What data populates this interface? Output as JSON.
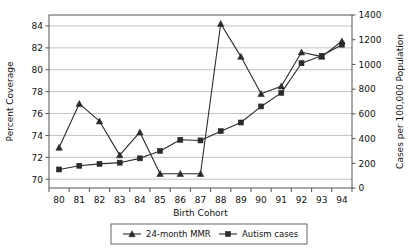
{
  "chart_data": {
    "type": "line",
    "title": "",
    "xlabel": "Birth Cohort",
    "ylabel": "Percent Coverage",
    "y2label": "Cases per 100,000 Population",
    "categories": [
      "80",
      "81",
      "82",
      "83",
      "84",
      "85",
      "86",
      "87",
      "88",
      "89",
      "90",
      "91",
      "92",
      "93",
      "94"
    ],
    "x_tick_labels": [
      "80",
      "81",
      "82",
      "83",
      "84",
      "85",
      "86",
      "87",
      "88",
      "89",
      "90",
      "91",
      "92",
      "93",
      "94"
    ],
    "y_tick_labels": [
      "70",
      "72",
      "74",
      "76",
      "78",
      "80",
      "82",
      "84"
    ],
    "y_ticks": [
      70,
      72,
      74,
      76,
      78,
      80,
      82,
      84
    ],
    "ylim": [
      69.2,
      85.0
    ],
    "y2_tick_labels": [
      "0",
      "200",
      "400",
      "600",
      "800",
      "1000",
      "1200",
      "1400"
    ],
    "y2_ticks": [
      0,
      200,
      400,
      600,
      800,
      1000,
      1200,
      1400
    ],
    "y2lim": [
      0,
      1400
    ],
    "grid": true,
    "grid_axis": "y",
    "legend_position": "bottom-center",
    "series": [
      {
        "name": "24-month MMR",
        "axis": "left",
        "marker": "triangle",
        "color": "#2b2b2b",
        "values": [
          72.9,
          76.9,
          75.3,
          72.2,
          74.3,
          70.5,
          70.5,
          70.5,
          84.2,
          81.2,
          77.8,
          78.5,
          81.6,
          81.2,
          82.6
        ]
      },
      {
        "name": "Autism cases",
        "axis": "right",
        "marker": "square",
        "color": "#2b2b2b",
        "values": [
          150,
          180,
          195,
          205,
          240,
          300,
          390,
          385,
          460,
          530,
          660,
          770,
          1010,
          1070,
          1160
        ]
      }
    ]
  },
  "legend": {
    "items": [
      {
        "label": "24-month MMR",
        "marker": "triangle"
      },
      {
        "label": "Autism cases",
        "marker": "square"
      }
    ]
  },
  "colors": {
    "line": "#2b2b2b",
    "grid": "#b4b4b4",
    "axis": "#555555",
    "text": "#111111",
    "background": "#ffffff"
  }
}
